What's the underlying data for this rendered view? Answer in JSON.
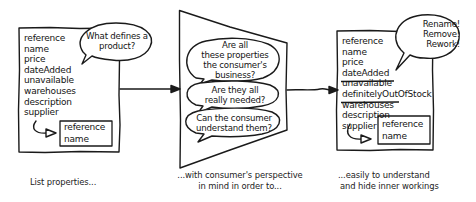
{
  "diagram": {
    "stages": [
      {
        "id": "list",
        "properties": [
          {
            "label": "reference",
            "removed": false
          },
          {
            "label": "name",
            "removed": false
          },
          {
            "label": "price",
            "removed": false
          },
          {
            "label": "dateAdded",
            "removed": false
          },
          {
            "label": "unavailable",
            "removed": false
          },
          {
            "label": "warehouses",
            "removed": false
          },
          {
            "label": "description",
            "removed": false
          },
          {
            "label": "supplier",
            "removed": false
          }
        ],
        "nested_box": [
          "reference",
          "name"
        ],
        "bubble": [
          "What defines a",
          "product?"
        ],
        "caption": [
          "List properties..."
        ]
      },
      {
        "id": "filter",
        "bubbles": [
          [
            "Are all",
            "these properties",
            "the consumer's",
            "business?"
          ],
          [
            "Are they all",
            "really needed?"
          ],
          [
            "Can the consumer",
            "understand them?"
          ]
        ],
        "caption": [
          "...with consumer's perspective",
          "in mind in order to..."
        ]
      },
      {
        "id": "result",
        "properties": [
          {
            "label": "reference",
            "removed": false
          },
          {
            "label": "name",
            "removed": false
          },
          {
            "label": "price",
            "removed": false
          },
          {
            "label": "dateAdded",
            "removed": false
          },
          {
            "label": "unavailable",
            "removed": true
          },
          {
            "label": "definitelyOutOfStock",
            "removed": false
          },
          {
            "label": "warehouses",
            "removed": true
          },
          {
            "label": "description",
            "removed": false
          },
          {
            "label": "supplier",
            "removed": false
          }
        ],
        "nested_box": [
          "reference",
          "name"
        ],
        "bubble": [
          "Rename!",
          "Remove!",
          "Rework!"
        ],
        "caption": [
          "...easily to understand",
          "and hide inner workings"
        ]
      }
    ],
    "colors": {
      "stroke": "#1a1a1a",
      "background": "#ffffff"
    }
  }
}
